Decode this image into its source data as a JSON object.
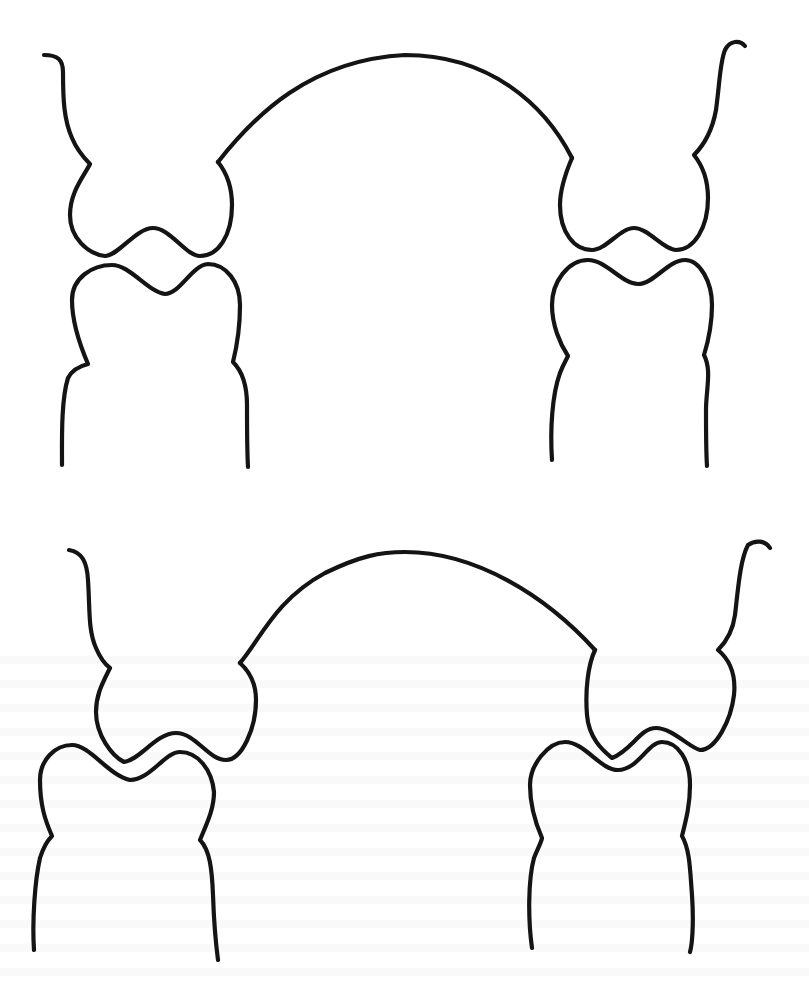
{
  "figure": {
    "type": "line-drawing",
    "subject": "dental occlusion diagram",
    "stroke_color": "#141414",
    "background_color": "#ffffff",
    "panels": [
      {
        "id": "top",
        "description": "cusp-to-cusp contact",
        "teeth": [
          "upper-left-tooth",
          "lower-left-tooth",
          "upper-right-tooth",
          "lower-right-tooth"
        ],
        "connector": "arch"
      },
      {
        "id": "bottom",
        "description": "interdigitated (cusp-to-fossa) contact",
        "teeth": [
          "upper-left-tooth",
          "lower-left-tooth",
          "upper-right-tooth",
          "lower-right-tooth"
        ],
        "connector": "arch"
      }
    ]
  }
}
